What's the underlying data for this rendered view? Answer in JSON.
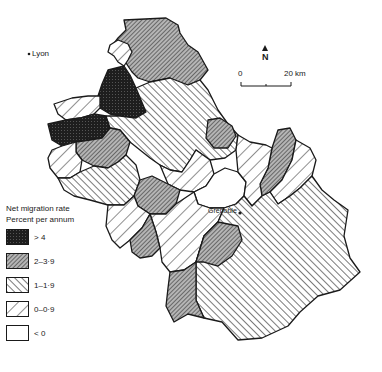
{
  "map": {
    "region": "Isère",
    "places": [
      {
        "name": "Lyon",
        "x": 32,
        "y": 57
      },
      {
        "name": "Grenoble",
        "x": 214,
        "y": 216
      }
    ],
    "north_label": "N",
    "scale": {
      "start": "0",
      "end": "20 km"
    }
  },
  "legend": {
    "title": "Net migration rate",
    "subtitle": "Percent per annum",
    "items": [
      {
        "label": "> 4",
        "pattern": "dense-black"
      },
      {
        "label": "2–3·9",
        "pattern": "fine-diagonal-gray"
      },
      {
        "label": "1–1·9",
        "pattern": "back-diagonal"
      },
      {
        "label": "0–0·9",
        "pattern": "forward-diagonal"
      },
      {
        "label": "< 0",
        "pattern": "blank"
      }
    ]
  },
  "colors": {
    "ink": "#1a1a1a",
    "dense": "#1e1e1e",
    "gray_fill": "#9a9a9a",
    "background": "#ffffff"
  }
}
